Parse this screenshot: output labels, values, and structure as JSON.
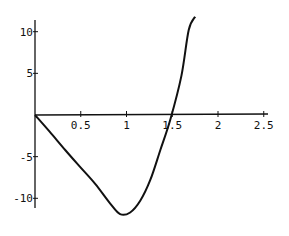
{
  "chart_data": {
    "type": "line",
    "title": "",
    "xlabel": "",
    "ylabel": "",
    "xlim": [
      0,
      2.6
    ],
    "ylim": [
      -13,
      12
    ],
    "grid": false,
    "legend": null,
    "x_ticks": [
      0.5,
      1,
      1.5,
      2,
      2.5
    ],
    "x_tick_labels": [
      "0.5",
      "1",
      "1.5",
      "2",
      "2.5"
    ],
    "y_ticks": [
      10,
      5,
      -5,
      -10
    ],
    "y_tick_labels": [
      "10",
      "5",
      "-5",
      "-10"
    ],
    "series": [
      {
        "name": "f(x)",
        "color": "#111111",
        "x": [
          0,
          0.16,
          0.33,
          0.49,
          0.66,
          0.82,
          0.93,
          1.04,
          1.15,
          1.26,
          1.37,
          1.48,
          1.6,
          1.68,
          1.75
        ],
        "y": [
          0,
          -2.0,
          -4.2,
          -6.2,
          -8.3,
          -10.6,
          -11.9,
          -11.7,
          -10.3,
          -7.8,
          -4.2,
          -0.5,
          4.7,
          10.2,
          11.8
        ]
      }
    ]
  }
}
